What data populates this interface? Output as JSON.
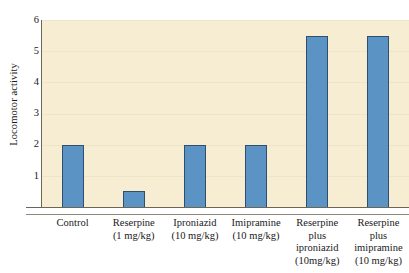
{
  "chart_data": {
    "type": "bar",
    "title": "",
    "subtitle": "",
    "xlabel": "",
    "ylabel": "Locomotor activity",
    "ylim": [
      0,
      6
    ],
    "yticks": [
      1,
      2,
      3,
      4,
      5,
      6
    ],
    "ytick_labels": [
      "1",
      "2",
      "3",
      "4",
      "5",
      "6"
    ],
    "grid": false,
    "legend": null,
    "categories": [
      "Control",
      "Reserpine (1 mg/kg)",
      "Iproniazid (10 mg/kg)",
      "Imipramine (10 mg/kg)",
      "Reserpine plus iproniazid (10mg/kg)",
      "Reserpine plus imipramine (10 mg/kg)"
    ],
    "category_lines": [
      [
        "Control"
      ],
      [
        "Reserpine",
        "(1 mg/kg)"
      ],
      [
        "Iproniazid",
        "(10 mg/kg)"
      ],
      [
        "Imipramine",
        "(10 mg/kg)"
      ],
      [
        "Reserpine",
        "plus",
        "iproniazid",
        "(10mg/kg)"
      ],
      [
        "Reserpine",
        "plus",
        "imipramine",
        "(10 mg/kg)"
      ]
    ],
    "values": [
      2.0,
      0.5,
      2.0,
      2.0,
      5.5,
      5.5
    ],
    "bar_color": "#5b93c4",
    "bar_edge_color": "#2f4f6e",
    "plot_background": "#f6edd3",
    "axis_color": "#6b6757",
    "figure_background": "#ffffff"
  }
}
